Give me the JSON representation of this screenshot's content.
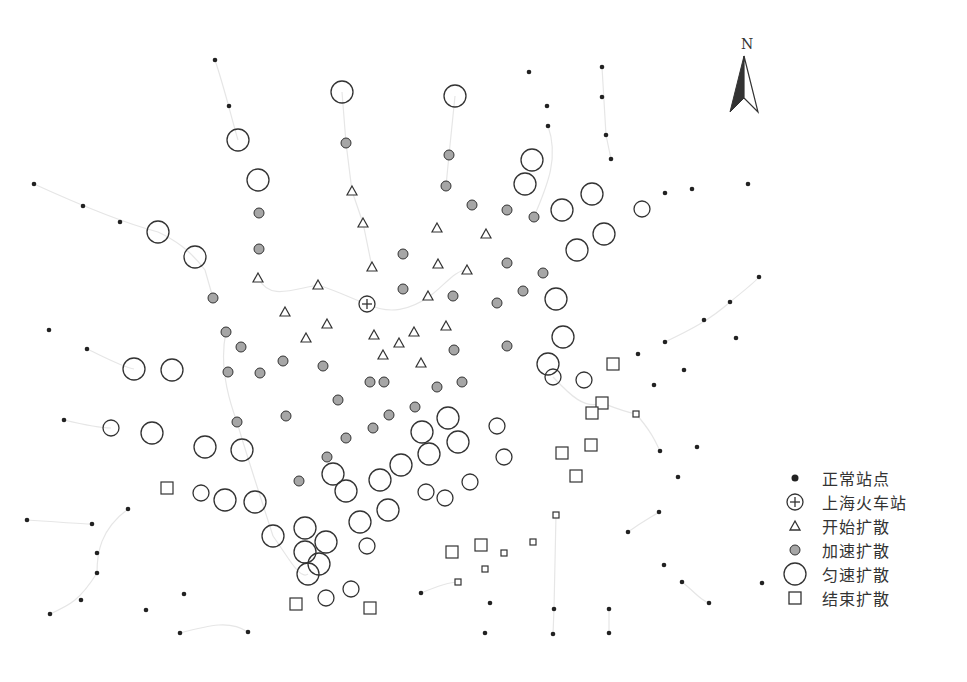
{
  "figure": {
    "north_label": "N",
    "caption": ""
  },
  "colors": {
    "stroke": "#333333",
    "normal_fill": "#222222",
    "accelerate_fill": "#a6a6a6",
    "line": "#e6e6e6",
    "background": "#ffffff"
  },
  "legend": {
    "items": [
      {
        "key": "normal",
        "symbol": "small-dot",
        "label": "正常站点"
      },
      {
        "key": "station",
        "symbol": "circle-plus",
        "label": "上海火车站"
      },
      {
        "key": "start",
        "symbol": "triangle",
        "label": "开始扩散"
      },
      {
        "key": "accelerate",
        "symbol": "gray-dot",
        "label": "加速扩散"
      },
      {
        "key": "uniform",
        "symbol": "large-circle",
        "label": "匀速扩散"
      },
      {
        "key": "end",
        "symbol": "square",
        "label": "结束扩散"
      }
    ]
  },
  "map_data": {
    "station": {
      "x": 367,
      "y": 304,
      "label": "上海火车站"
    },
    "normal": [
      [
        215,
        60
      ],
      [
        229,
        106
      ],
      [
        34,
        184
      ],
      [
        83,
        206
      ],
      [
        120,
        222
      ],
      [
        49,
        330
      ],
      [
        87,
        349
      ],
      [
        64,
        420
      ],
      [
        27,
        520
      ],
      [
        92,
        524
      ],
      [
        128,
        509
      ],
      [
        97,
        573
      ],
      [
        81,
        600
      ],
      [
        50,
        614
      ],
      [
        146,
        610
      ],
      [
        180,
        633
      ],
      [
        184,
        594
      ],
      [
        248,
        632
      ],
      [
        97,
        553
      ],
      [
        529,
        72
      ],
      [
        602,
        67
      ],
      [
        547,
        106
      ],
      [
        602,
        97
      ],
      [
        548,
        126
      ],
      [
        606,
        135
      ],
      [
        611,
        159
      ],
      [
        665,
        193
      ],
      [
        692,
        189
      ],
      [
        748,
        184
      ],
      [
        759,
        277
      ],
      [
        730,
        302
      ],
      [
        704,
        320
      ],
      [
        736,
        338
      ],
      [
        665,
        342
      ],
      [
        638,
        354
      ],
      [
        684,
        370
      ],
      [
        654,
        385
      ],
      [
        660,
        451
      ],
      [
        697,
        447
      ],
      [
        678,
        477
      ],
      [
        659,
        512
      ],
      [
        628,
        532
      ],
      [
        664,
        565
      ],
      [
        682,
        582
      ],
      [
        709,
        603
      ],
      [
        762,
        583
      ],
      [
        421,
        593
      ],
      [
        490,
        603
      ],
      [
        554,
        609
      ],
      [
        609,
        609
      ],
      [
        553,
        634
      ],
      [
        485,
        633
      ],
      [
        609,
        633
      ]
    ],
    "start": [
      [
        352,
        191
      ],
      [
        363,
        223
      ],
      [
        437,
        228
      ],
      [
        486,
        234
      ],
      [
        258,
        278
      ],
      [
        318,
        285
      ],
      [
        285,
        312
      ],
      [
        372,
        267
      ],
      [
        438,
        264
      ],
      [
        467,
        270
      ],
      [
        428,
        296
      ],
      [
        446,
        326
      ],
      [
        374,
        335
      ],
      [
        414,
        332
      ],
      [
        399,
        343
      ],
      [
        383,
        355
      ],
      [
        421,
        363
      ],
      [
        327,
        324
      ],
      [
        306,
        338
      ]
    ],
    "accelerate": [
      [
        346,
        143
      ],
      [
        449,
        155
      ],
      [
        446,
        186
      ],
      [
        259,
        213
      ],
      [
        472,
        205
      ],
      [
        507,
        210
      ],
      [
        534,
        217
      ],
      [
        259,
        249
      ],
      [
        403,
        254
      ],
      [
        507,
        263
      ],
      [
        543,
        273
      ],
      [
        213,
        298
      ],
      [
        403,
        289
      ],
      [
        453,
        296
      ],
      [
        523,
        291
      ],
      [
        497,
        303
      ],
      [
        226,
        332
      ],
      [
        241,
        347
      ],
      [
        454,
        350
      ],
      [
        507,
        346
      ],
      [
        283,
        361
      ],
      [
        323,
        366
      ],
      [
        228,
        372
      ],
      [
        260,
        373
      ],
      [
        370,
        382
      ],
      [
        384,
        382
      ],
      [
        437,
        387
      ],
      [
        462,
        382
      ],
      [
        338,
        400
      ],
      [
        415,
        407
      ],
      [
        389,
        415
      ],
      [
        286,
        416
      ],
      [
        237,
        422
      ],
      [
        373,
        428
      ],
      [
        346,
        438
      ],
      [
        327,
        457
      ],
      [
        299,
        481
      ]
    ],
    "uniform": [
      [
        342,
        92,
        11
      ],
      [
        455,
        96,
        11
      ],
      [
        238,
        140,
        11
      ],
      [
        258,
        180,
        11
      ],
      [
        532,
        160,
        11
      ],
      [
        525,
        184,
        11
      ],
      [
        158,
        232,
        11
      ],
      [
        195,
        257,
        11
      ],
      [
        562,
        210,
        11
      ],
      [
        592,
        194,
        11
      ],
      [
        604,
        234,
        11
      ],
      [
        577,
        250,
        11
      ],
      [
        642,
        209,
        8
      ],
      [
        556,
        299,
        11
      ],
      [
        563,
        337,
        11
      ],
      [
        548,
        364,
        11
      ],
      [
        553,
        377,
        8
      ],
      [
        584,
        380,
        8
      ],
      [
        134,
        369,
        11
      ],
      [
        172,
        370,
        11
      ],
      [
        111,
        428,
        8
      ],
      [
        152,
        433,
        11
      ],
      [
        205,
        447,
        11
      ],
      [
        242,
        450,
        11
      ],
      [
        448,
        418,
        11
      ],
      [
        422,
        432,
        11
      ],
      [
        458,
        442,
        11
      ],
      [
        429,
        454,
        11
      ],
      [
        497,
        426,
        8
      ],
      [
        504,
        457,
        8
      ],
      [
        401,
        465,
        11
      ],
      [
        380,
        480,
        11
      ],
      [
        333,
        474,
        11
      ],
      [
        346,
        491,
        11
      ],
      [
        470,
        482,
        8
      ],
      [
        426,
        492,
        8
      ],
      [
        445,
        498,
        8
      ],
      [
        201,
        493,
        8
      ],
      [
        225,
        500,
        11
      ],
      [
        255,
        502,
        11
      ],
      [
        388,
        510,
        11
      ],
      [
        360,
        522,
        11
      ],
      [
        273,
        536,
        11
      ],
      [
        305,
        528,
        11
      ],
      [
        326,
        542,
        11
      ],
      [
        305,
        552,
        11
      ],
      [
        319,
        564,
        11
      ],
      [
        308,
        574,
        11
      ],
      [
        367,
        546,
        8
      ],
      [
        326,
        598,
        8
      ],
      [
        351,
        589,
        8
      ]
    ],
    "end": [
      [
        613,
        364,
        6
      ],
      [
        602,
        403,
        6
      ],
      [
        592,
        413,
        6
      ],
      [
        636,
        414,
        3
      ],
      [
        591,
        445,
        6
      ],
      [
        562,
        453,
        6
      ],
      [
        576,
        476,
        6
      ],
      [
        167,
        488,
        6
      ],
      [
        556,
        515,
        3
      ],
      [
        452,
        552,
        6
      ],
      [
        481,
        545,
        6
      ],
      [
        504,
        553,
        3
      ],
      [
        533,
        542,
        3
      ],
      [
        485,
        569,
        3
      ],
      [
        458,
        582,
        3
      ],
      [
        296,
        604,
        6
      ],
      [
        370,
        608,
        6
      ]
    ],
    "routes": [
      "M215,60 C225,90 232,120 238,140",
      "M34,184 C80,205 120,222 158,232 C175,240 190,250 205,270 L213,298",
      "M226,332 C220,360 225,390 237,422 C245,450 255,480 273,536",
      "M273,536 C290,560 300,580 308,574",
      "M258,278 C270,300 290,290 318,285 C340,292 355,300 367,304 C390,315 410,310 430,296 C445,285 455,270 467,270",
      "M342,92 L346,143 L352,191 L363,223 L372,267",
      "M455,96 L449,155 L446,186",
      "M602,67 L606,135 L611,159",
      "M548,126 C560,160 545,190 534,217",
      "M87,349 C110,360 125,368 134,369",
      "M64,420 C85,425 100,428 111,428",
      "M27,520 C60,522 80,524 92,524",
      "M128,509 C100,530 97,553 97,573",
      "M50,614 C70,605 80,600 97,573",
      "M180,633 C210,625 230,620 248,632",
      "M421,593 C440,585 450,582 458,582",
      "M553,634 L554,609 L556,515",
      "M609,633 L609,609",
      "M636,414 C650,430 655,440 660,451",
      "M628,532 C645,520 655,515 659,512",
      "M682,582 C695,592 700,600 709,603",
      "M553,377 C570,395 585,410 602,403 C615,408 625,412 636,414",
      "M665,342 C690,330 710,320 730,302 C745,290 755,282 759,277"
    ]
  }
}
